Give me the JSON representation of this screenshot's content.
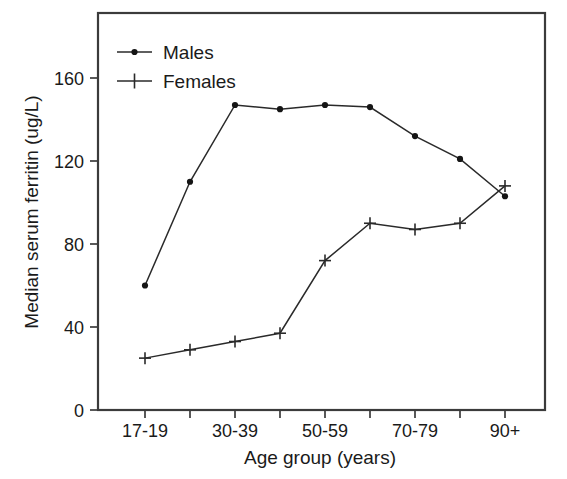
{
  "chart_data": {
    "type": "line",
    "title": "",
    "xlabel": "Age group (years)",
    "ylabel": "Median serum ferritin (ug/L)",
    "categories": [
      "17-19",
      "20-29",
      "30-39",
      "40-49",
      "50-59",
      "60-69",
      "70-79",
      "80-89",
      "90+"
    ],
    "xtick_labels_shown": [
      "17-19",
      "30-39",
      "50-59",
      "70-79",
      "90+"
    ],
    "xtick_labels_shown_indices": [
      0,
      2,
      4,
      6,
      8
    ],
    "ytick_labels": [
      "0",
      "40",
      "80",
      "120",
      "160"
    ],
    "ytick_values": [
      0,
      40,
      80,
      120,
      160
    ],
    "ylim": [
      0,
      176
    ],
    "grid": false,
    "legend_position": "top-left",
    "series": [
      {
        "name": "Males",
        "marker": "dot",
        "color": "#151515",
        "values": [
          60,
          110,
          147,
          145,
          147,
          146,
          132,
          121,
          103
        ]
      },
      {
        "name": "Females",
        "marker": "plus",
        "color": "#2a2a2a",
        "values": [
          25,
          29,
          33,
          37,
          72,
          90,
          87,
          90,
          108
        ]
      }
    ]
  },
  "axes": {
    "y_axis_title": "Median serum ferritin (ug/L)",
    "x_axis_title": "Age group (years)"
  },
  "legend": {
    "entries": [
      {
        "label": "Males",
        "marker": "dot"
      },
      {
        "label": "Females",
        "marker": "plus"
      }
    ]
  },
  "ticks": {
    "y": [
      {
        "label": "160",
        "value": 160
      },
      {
        "label": "120",
        "value": 120
      },
      {
        "label": "80",
        "value": 80
      },
      {
        "label": "40",
        "value": 40
      },
      {
        "label": "0",
        "value": 0
      }
    ],
    "x": [
      {
        "label": "17-19",
        "index": 0
      },
      {
        "label": "30-39",
        "index": 2
      },
      {
        "label": "50-59",
        "index": 4
      },
      {
        "label": "70-79",
        "index": 6
      },
      {
        "label": "90+",
        "index": 8
      }
    ]
  }
}
